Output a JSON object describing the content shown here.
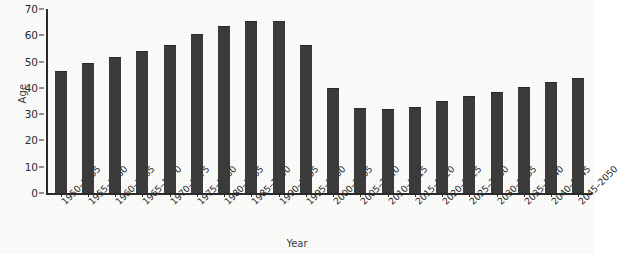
{
  "chart_data": {
    "type": "bar",
    "title": "",
    "xlabel": "Year",
    "ylabel": "Age",
    "ylim": [
      0,
      70
    ],
    "yticks": [
      0,
      10,
      20,
      30,
      40,
      50,
      60,
      70
    ],
    "grid": false,
    "legend": null,
    "bar_color": "#3b3b3b",
    "background_color": "#fbfbfa",
    "axis_color": "#2a2a2a",
    "categories": [
      "1950–1955",
      "1955–1960",
      "1960–1965",
      "1965–1970",
      "1970–1975",
      "1975–1980",
      "1980–1985",
      "1985–1990",
      "1990–1995",
      "1995–2000",
      "2000–2005",
      "2005–2010",
      "2010–2015",
      "2015–2020",
      "2020–2025",
      "2025–2030",
      "2030–2035",
      "2035–2040",
      "2040–2045",
      "2045–2050"
    ],
    "values": [
      46,
      49,
      51.5,
      53.5,
      56,
      60,
      63,
      65,
      65,
      56,
      39.5,
      32,
      31.5,
      32.5,
      34.5,
      36.5,
      38,
      40,
      42,
      43.5
    ]
  }
}
